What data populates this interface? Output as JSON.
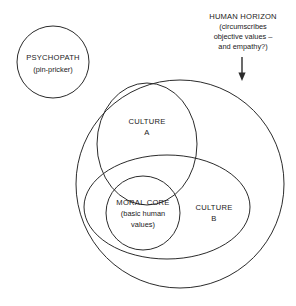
{
  "diagram": {
    "background_color": "#ffffff",
    "stroke_color": "#2b2b2b",
    "text_color": "#1a1a1a",
    "annotation": {
      "heading": "HUMAN HORIZON",
      "line1": "(circumscribes",
      "line2": "objective values –",
      "line3": "and empathy?)",
      "pointer": "down-arrow"
    },
    "regions": [
      {
        "id": "psychopath",
        "shape": "circle",
        "title": "PSYCHOPATH",
        "subtitle": "(pin-pricker)"
      },
      {
        "id": "human-horizon",
        "shape": "circle",
        "title": "",
        "subtitle": ""
      },
      {
        "id": "culture-a",
        "shape": "ellipse",
        "title": "CULTURE",
        "subtitle": "A"
      },
      {
        "id": "culture-b",
        "shape": "ellipse",
        "title": "CULTURE",
        "subtitle": "B"
      },
      {
        "id": "moral-core",
        "shape": "circle",
        "title": "MORAL CORE",
        "subtitle_line1": "(basic human",
        "subtitle_line2": "values)"
      }
    ]
  }
}
